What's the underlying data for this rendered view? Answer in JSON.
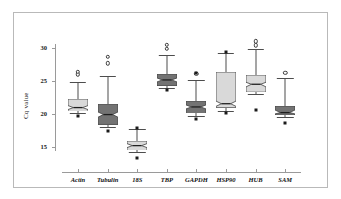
{
  "figure": {
    "border_color": "#b9b9b9",
    "background": "#ffffff"
  },
  "axes": {
    "ylabel": "Cq value",
    "xlabel": "",
    "yticks": [
      15,
      20,
      25,
      30
    ],
    "ytick_labels": [
      "15",
      "20",
      "25",
      "30"
    ],
    "ylim": [
      12.6,
      30.6
    ],
    "axis_color": "#9a9a9a"
  },
  "chart_data": {
    "type": "box",
    "title": "",
    "xlabel": "",
    "ylabel": "Cq value",
    "ylim": [
      12.6,
      30.6
    ],
    "yticks": [
      15,
      20,
      25,
      30
    ],
    "grid": false,
    "legend": "none",
    "notched": true,
    "categories": [
      "Actin",
      "Tubulin",
      "18S",
      "TBP",
      "GAPDH",
      "HSP90",
      "HUB",
      "SAM"
    ],
    "boxes": [
      {
        "label": "Actin",
        "fill": "#d9d9d9",
        "whisker_low": 20.1,
        "q1": 20.4,
        "median": 21.0,
        "q3": 22.3,
        "whisker_high": 24.9,
        "notch_low": 20.7,
        "notch_high": 21.3,
        "outliers": [
          26.0,
          26.4
        ],
        "extremes": [
          19.7
        ]
      },
      {
        "label": "Tubulin",
        "fill": "#737373",
        "whisker_low": 18.0,
        "q1": 18.4,
        "median": 19.9,
        "q3": 21.5,
        "whisker_high": 25.8,
        "notch_low": 19.5,
        "notch_high": 20.3,
        "outliers": [
          27.7,
          28.7
        ],
        "extremes": [
          17.4
        ]
      },
      {
        "label": "18S",
        "fill": "#d9d9d9",
        "whisker_low": 14.2,
        "q1": 14.5,
        "median": 15.3,
        "q3": 16.0,
        "whisker_high": 17.8,
        "notch_low": 15.0,
        "notch_high": 15.6,
        "outliers": [],
        "extremes": [
          13.4,
          17.9
        ]
      },
      {
        "label": "TBP",
        "fill": "#737373",
        "whisker_low": 23.9,
        "q1": 24.2,
        "median": 25.1,
        "q3": 26.0,
        "whisker_high": 29.0,
        "notch_low": 24.8,
        "notch_high": 25.4,
        "outliers": [
          29.9,
          30.5
        ],
        "extremes": [
          23.6
        ]
      },
      {
        "label": "GAPDH",
        "fill": "#737373",
        "whisker_low": 19.7,
        "q1": 20.1,
        "median": 21.1,
        "q3": 22.0,
        "whisker_high": 25.2,
        "notch_low": 20.8,
        "notch_high": 21.4,
        "outliers": [
          26.1
        ],
        "extremes": [
          19.2,
          26.2
        ]
      },
      {
        "label": "HSP90",
        "fill": "#d9d9d9",
        "whisker_low": 20.4,
        "q1": 20.9,
        "median": 21.5,
        "q3": 26.3,
        "whisker_high": 29.2,
        "notch_low": 21.1,
        "notch_high": 21.9,
        "outliers": [],
        "extremes": [
          20.1,
          29.4
        ]
      },
      {
        "label": "HUB",
        "fill": "#d9d9d9",
        "whisker_low": 23.0,
        "q1": 23.3,
        "median": 24.5,
        "q3": 25.9,
        "whisker_high": 29.8,
        "notch_low": 24.1,
        "notch_high": 24.8,
        "outliers": [
          30.4,
          31.0
        ],
        "extremes": [
          20.6
        ]
      },
      {
        "label": "SAM",
        "fill": "#737373",
        "whisker_low": 19.5,
        "q1": 19.8,
        "median": 20.2,
        "q3": 21.2,
        "whisker_high": 25.4,
        "notch_low": 20.0,
        "notch_high": 20.6,
        "outliers": [
          26.2
        ],
        "extremes": [
          18.7
        ]
      }
    ]
  }
}
